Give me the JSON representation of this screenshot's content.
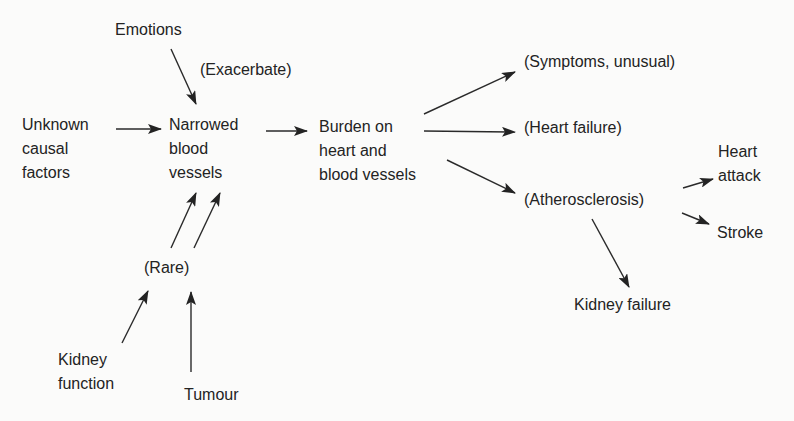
{
  "diagram": {
    "background": "#fbfbfa",
    "ink": "#232323",
    "nodes": {
      "emotions": "Emotions",
      "exacerbate": "(Exacerbate)",
      "unknown": "Unknown\ncausal\nfactors",
      "narrowed": "Narrowed\nblood\nvessels",
      "burden": "Burden on\nheart and\nblood vessels",
      "symptoms": "(Symptoms, unusual)",
      "heart_failure": "(Heart failure)",
      "atherosclerosis": "(Atherosclerosis)",
      "heart_attack": "Heart\nattack",
      "stroke": "Stroke",
      "kidney_failure": "Kidney failure",
      "rare": "(Rare)",
      "kidney_function": "Kidney\nfunction",
      "tumour": "Tumour"
    },
    "edges": [
      {
        "from": "Emotions",
        "to": "Narrowed blood vessels",
        "label": "(Exacerbate)"
      },
      {
        "from": "Unknown causal factors",
        "to": "Narrowed blood vessels"
      },
      {
        "from": "(Rare)",
        "to": "Narrowed blood vessels",
        "count": 2
      },
      {
        "from": "Kidney function",
        "to": "(Rare)"
      },
      {
        "from": "Tumour",
        "to": "(Rare)"
      },
      {
        "from": "Narrowed blood vessels",
        "to": "Burden on heart and blood vessels"
      },
      {
        "from": "Burden on heart and blood vessels",
        "to": "(Symptoms, unusual)"
      },
      {
        "from": "Burden on heart and blood vessels",
        "to": "(Heart failure)"
      },
      {
        "from": "Burden on heart and blood vessels",
        "to": "(Atherosclerosis)"
      },
      {
        "from": "(Atherosclerosis)",
        "to": "Heart attack"
      },
      {
        "from": "(Atherosclerosis)",
        "to": "Stroke"
      },
      {
        "from": "(Atherosclerosis)",
        "to": "Kidney failure"
      }
    ]
  }
}
